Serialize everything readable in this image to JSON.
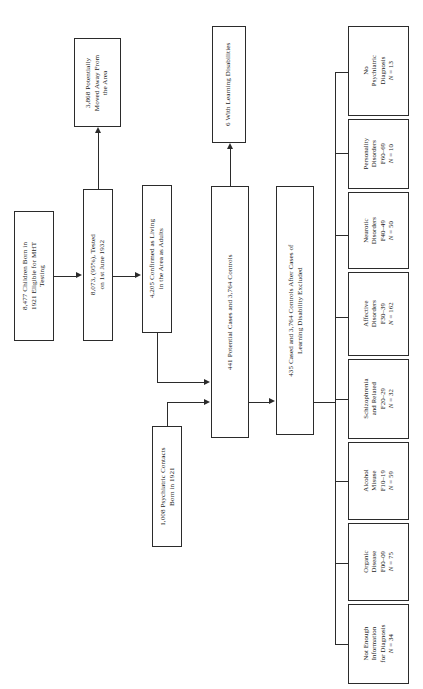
{
  "figure": {
    "type": "flowchart",
    "orientation": "rotated-90-ccw",
    "nodes": {
      "cohort": "8,477 Children Born in\n1921 Eligible for MHT\nTesting",
      "tested": "8,073, (95%), Tested\non 1st June 1932",
      "moved_away": "3,868 Potentially\nMoved Away From\nthe Area",
      "confirmed_living": "4,205 Confirmed as Living\nin the Area as Adults",
      "psych_contacts": "1,008 Psychiatric Contacts\nBorn in 1921",
      "potential_cases": "441 Potential Cases and 3,764 Controls",
      "learning_disabilities": "6 With Learning Disabilities",
      "after_exclusion": "435 Cased and 3,764 Controls After Cases of\nLearning Disability Excluded"
    },
    "diagnoses": [
      {
        "id": "no-psychiatric-diagnosis",
        "label": "No\nPsychiatric\nDiagnosis",
        "code": "",
        "n": "N = 13"
      },
      {
        "id": "personality-disorders",
        "label": "Personality\nDisorders",
        "code": "F60–69",
        "n": "N = 10"
      },
      {
        "id": "neurotic-disorders",
        "label": "Neurotic\nDisorders",
        "code": "F40–49",
        "n": "N = 50"
      },
      {
        "id": "affective-disorders",
        "label": "Affective\nDisorders",
        "code": "F30–39",
        "n": "N = 162"
      },
      {
        "id": "schizophrenia-and-related",
        "label": "Schizophrenia\nand Related",
        "code": "F20–29",
        "n": "N = 32"
      },
      {
        "id": "alcohol-misuse",
        "label": "Alcohol\nMisuse",
        "code": "F10–19",
        "n": "N = 59"
      },
      {
        "id": "organic-disease",
        "label": "Organic\nDisease",
        "code": "F00–09",
        "n": "N = 75"
      },
      {
        "id": "not-enough-information",
        "label": "Not Enough\nInformation\nfor Diagnosis",
        "code": "",
        "n": "N = 34"
      }
    ],
    "colors": {
      "stroke": "#2b2b2b",
      "background": "#ffffff",
      "text": "#1a1a1a"
    }
  }
}
